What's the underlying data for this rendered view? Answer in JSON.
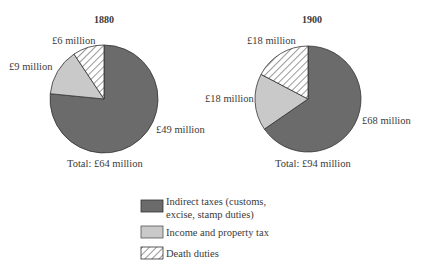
{
  "chart_data": [
    {
      "type": "pie",
      "title": "1880",
      "categories": [
        "Indirect taxes (customs, excise, stamp duties)",
        "Income and property tax",
        "Death duties"
      ],
      "values": [
        49,
        9,
        6
      ],
      "value_labels": [
        "£49 million",
        "£9 million",
        "£6 million"
      ],
      "units": "£ million",
      "total_label": "Total: £64 million"
    },
    {
      "type": "pie",
      "title": "1900",
      "categories": [
        "Indirect taxes (customs, excise, stamp duties)",
        "Income and property tax",
        "Death duties"
      ],
      "values": [
        68,
        18,
        18
      ],
      "value_labels": [
        "£68 million",
        "£18 million",
        "£18 million"
      ],
      "units": "£ million",
      "total_label": "Total: £94 million"
    }
  ],
  "legend": {
    "items": [
      {
        "label_line1": "Indirect taxes (customs,",
        "label_line2": "excise, stamp duties)",
        "style": "dark-fill",
        "color": "#6b6b6b"
      },
      {
        "label_line1": "Income and property tax",
        "style": "light-fill",
        "color": "#c8c8c8"
      },
      {
        "label_line1": "Death duties",
        "style": "hatched",
        "color": "#ffffff"
      }
    ]
  },
  "colors": {
    "indirect": "#6b6b6b",
    "income": "#c9c9c9",
    "death_bg": "#ffffff",
    "outline": "#333333"
  }
}
